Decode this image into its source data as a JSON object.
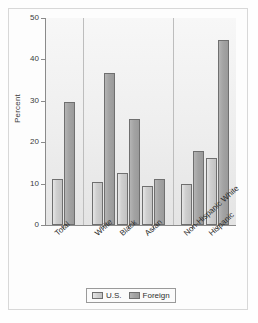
{
  "chart_data": {
    "type": "bar",
    "title": "",
    "xlabel": "",
    "ylabel": "Percent",
    "ylim": [
      0,
      50
    ],
    "yticks": [
      0,
      10,
      20,
      30,
      40,
      50
    ],
    "ytick_labels": [
      "0",
      "10",
      "20",
      "30",
      "40",
      "50"
    ],
    "grid": false,
    "legend_position": "bottom",
    "categories": [
      "Total",
      "White",
      "Black",
      "Asian",
      "Non-Hispanic White",
      "Hispanic"
    ],
    "series": [
      {
        "name": "U.S.",
        "values": [
          11.0,
          10.5,
          12.5,
          9.5,
          9.8,
          16.3
        ]
      },
      {
        "name": "Foreign",
        "values": [
          29.8,
          36.7,
          25.6,
          11.2,
          17.8,
          44.6
        ]
      }
    ],
    "group_separators_after": [
      "Total",
      "Asian"
    ],
    "colors": {
      "us": "#cfcfcf",
      "foreign": "#a3a3a3",
      "bar_outline": "#6f6f6f",
      "axis": "#8a8a8a",
      "plot_background": "#efefef",
      "separator": "#bdbdbd",
      "text": "#2e2e2e"
    }
  },
  "legend": {
    "items": [
      {
        "label": "U.S.",
        "key": "us"
      },
      {
        "label": "Foreign",
        "key": "foreign"
      }
    ]
  }
}
